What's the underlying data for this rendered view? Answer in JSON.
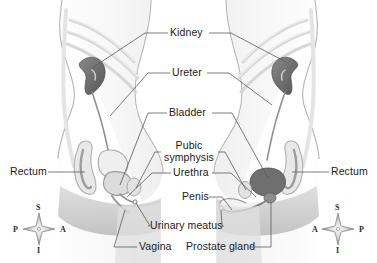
{
  "diagram": {
    "background_color": "#ffffff",
    "line_color": "#555555",
    "text_color": "#1a1a1a",
    "organ_dark_color": "#6e6e6e",
    "organ_mid_color": "#9a9a9a",
    "organ_light_color": "#d9d9d9",
    "body_outline_color": "#aaaaaa",
    "body_fill_color": "#fbfbfb"
  },
  "labels": {
    "kidney": "Kidney",
    "ureter": "Ureter",
    "bladder": "Bladder",
    "pubic_symphysis_line1": "Pubic",
    "pubic_symphysis_line2": "symphysis",
    "urethra": "Urethra",
    "penis": "Penis",
    "urinary_meatus": "Urinary meatus",
    "vagina": "Vagina",
    "prostate_gland": "Prostate gland",
    "rectum_left": "Rectum",
    "rectum_right": "Rectum"
  },
  "compass_left": {
    "superior": "S",
    "inferior": "I",
    "posterior": "P",
    "anterior": "A"
  },
  "compass_right": {
    "superior": "S",
    "inferior": "I",
    "anterior": "A",
    "posterior": "P"
  },
  "figures": {
    "left": {
      "name": "female-torso-sagittal-section"
    },
    "right": {
      "name": "male-torso-sagittal-section"
    }
  }
}
